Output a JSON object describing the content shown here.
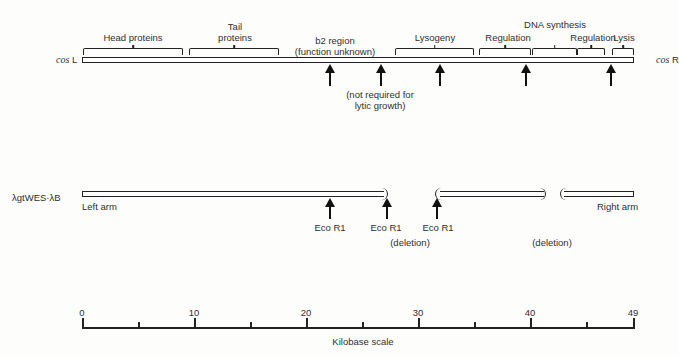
{
  "top_map": {
    "left_label": {
      "prefix": "cos",
      "suffix": "L"
    },
    "right_label": {
      "prefix": "cos",
      "suffix": "R"
    },
    "regions": [
      {
        "label": "Head proteins"
      },
      {
        "label_line1": "Tail",
        "label_line2": "proteins"
      },
      {
        "label_line1": "b2 region",
        "label_line2": "(function unknown)"
      },
      {
        "label": "Lysogeny"
      },
      {
        "label": "DNA synthesis"
      },
      {
        "label": "Regulation"
      },
      {
        "label": "Regulation"
      },
      {
        "label": "Lysis"
      }
    ],
    "annotation_line1": "(not required for",
    "annotation_line2": "lytic growth)"
  },
  "vector_map": {
    "name": "λgtWES·λB",
    "left_arm": "Left arm",
    "right_arm": "Right arm",
    "sites": [
      "Eco R1",
      "Eco R1",
      "Eco R1"
    ],
    "deletions": [
      "(deletion)",
      "(deletion)"
    ]
  },
  "scale": {
    "ticks": [
      "0",
      "10",
      "20",
      "30",
      "40",
      "49"
    ],
    "label": "Kilobase scale",
    "min": 0,
    "max": 49,
    "minor_step": 5
  }
}
